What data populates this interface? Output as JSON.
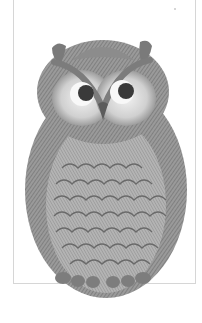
{
  "illustration": {
    "subject": "owl",
    "style": "grayscale engraving",
    "colors": {
      "background": "#ffffff",
      "frame": "#d6d6d6",
      "ink_dark": "#5a5a5a",
      "ink_mid": "#8a8a8a",
      "ink_light": "#bdbdbd",
      "face_light": "#ececec"
    }
  }
}
